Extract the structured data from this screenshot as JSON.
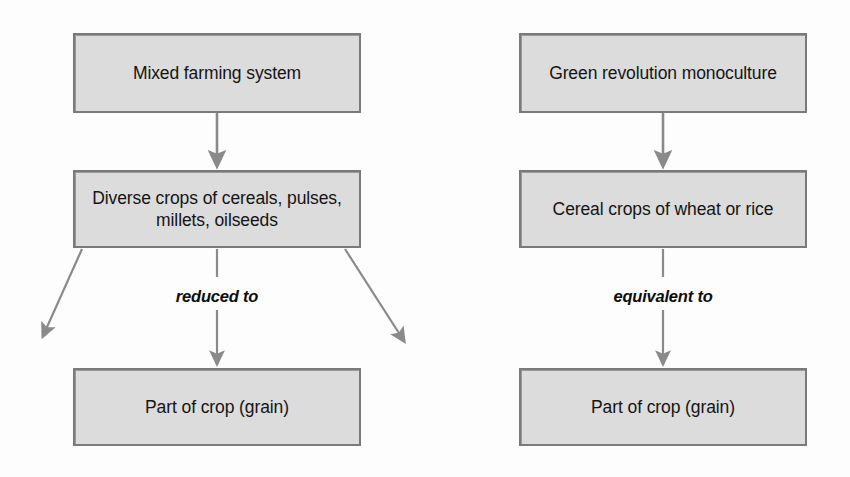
{
  "diagram": {
    "colors": {
      "box_fill": "#dcdcdc",
      "box_border": "#7a7a7a",
      "arrow": "#8a8a8a",
      "text": "#141414",
      "background": "#fdfdfd"
    },
    "columns": [
      {
        "name": "mixed-farming",
        "nodes": [
          {
            "id": "mixed-farming-system",
            "label": "Mixed farming system"
          },
          {
            "id": "diverse-crops",
            "label": "Diverse crops of cereals, pulses,\nmillets, oilseeds"
          },
          {
            "id": "part-of-crop-left",
            "label": "Part of crop (grain)"
          }
        ],
        "edge_label": "reduced to"
      },
      {
        "name": "green-revolution",
        "nodes": [
          {
            "id": "green-revolution-monoculture",
            "label": "Green revolution monoculture"
          },
          {
            "id": "cereal-crops",
            "label": "Cereal crops of wheat or rice"
          },
          {
            "id": "part-of-crop-right",
            "label": "Part of crop (grain)"
          }
        ],
        "edge_label": "equivalent to"
      }
    ]
  }
}
